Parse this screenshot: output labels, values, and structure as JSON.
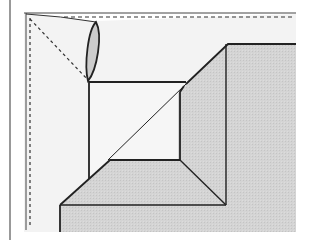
{
  "diagram": {
    "type": "origami-fold-step",
    "colors": {
      "background": "#ffffff",
      "paper": "#f4f4f4",
      "folded_panel": "#d2d2d2",
      "lens_fill": "#cfcfcf",
      "line": "#222222",
      "dashed_line": "#333333"
    },
    "labels": []
  }
}
